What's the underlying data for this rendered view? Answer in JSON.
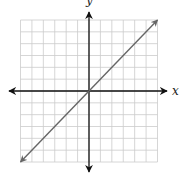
{
  "chart_data": {
    "type": "line",
    "title": "",
    "xlabel": "x",
    "ylabel": "y",
    "xlim": [
      -6,
      6
    ],
    "ylim": [
      -6,
      6
    ],
    "grid": true,
    "grid_step": 1,
    "legend": null,
    "series": [
      {
        "name": "y = x",
        "x": [
          -6,
          6
        ],
        "y": [
          -6,
          6
        ],
        "arrows_both_ends": true,
        "color": "#666666"
      }
    ],
    "tick_labels": []
  },
  "labels": {
    "x_axis": "x",
    "y_axis": "y"
  },
  "colors": {
    "grid": "#cccccc",
    "axes": "#111111",
    "line": "#666666"
  }
}
